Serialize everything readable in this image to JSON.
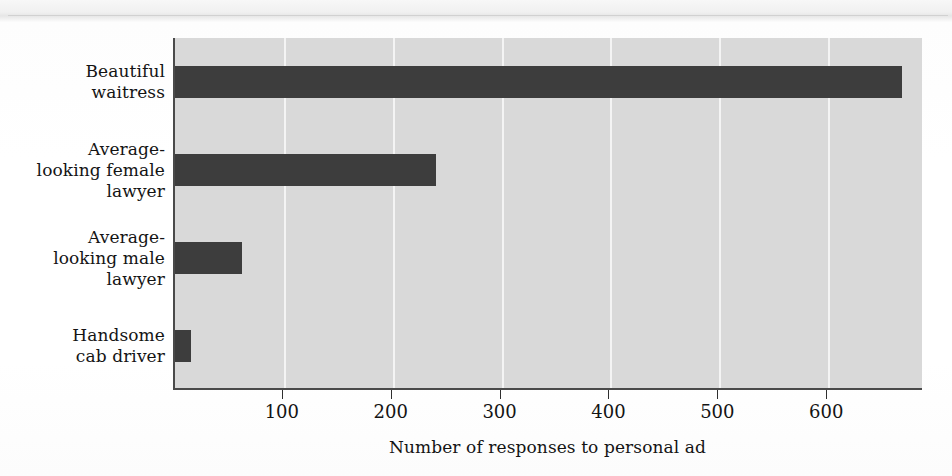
{
  "chart_data": {
    "type": "bar",
    "orientation": "horizontal",
    "title": "",
    "xlabel": "Number of responses to personal ad",
    "ylabel": "",
    "categories": [
      "Beautiful waitress",
      "Average-looking female lawyer",
      "Average-looking male lawyer",
      "Handsome cab driver"
    ],
    "category_lines": [
      [
        "Beautiful",
        "waitress"
      ],
      [
        "Average-",
        "looking female",
        "lawyer"
      ],
      [
        "Average-",
        "looking male",
        "lawyer"
      ],
      [
        "Handsome",
        "cab driver"
      ]
    ],
    "values": [
      668,
      240,
      62,
      15
    ],
    "xlim": [
      0,
      688
    ],
    "xticks": [
      100,
      200,
      300,
      400,
      500,
      600
    ],
    "xtick_labels": [
      "100",
      "200",
      "300",
      "400",
      "500",
      "600"
    ],
    "grid": true,
    "grid_axis": "x",
    "legend": null,
    "bar_color": "#3d3d3d",
    "plot_background": "#d9d9d9",
    "gridline_color": "#f4f4f4",
    "axis_color": "#4a4a4a",
    "page_background": "#ffffff"
  }
}
